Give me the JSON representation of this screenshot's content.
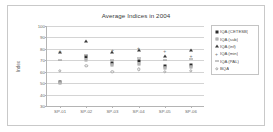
{
  "chart_data": {
    "type": "scatter",
    "title": "Average Indices in 2004",
    "xlabel": "",
    "ylabel": "Index",
    "grid": true,
    "legend_position": "right",
    "ylim": [
      30,
      100
    ],
    "yticks": [
      30,
      40,
      50,
      60,
      70,
      80,
      90,
      100
    ],
    "categories": [
      "SP-01",
      "SP-02",
      "SP-03",
      "SP-04",
      "SP-05",
      "SP-06"
    ],
    "series": [
      {
        "name": "IQA (CETESB)",
        "marker": "filled-square",
        "color": "#2b2b2b",
        "values": [
          51,
          73,
          68,
          69,
          65,
          66
        ]
      },
      {
        "name": "IQA (sub)",
        "marker": "open-square",
        "color": "#9a9a9a",
        "values": [
          50,
          70,
          66,
          67,
          63,
          64
        ]
      },
      {
        "name": "IQA (inf)",
        "marker": "filled-triangle",
        "color": "#3a3a3a",
        "values": [
          77,
          87,
          77,
          79,
          74,
          79
        ]
      },
      {
        "name": "IQA (min)",
        "marker": "plus",
        "color": "#777777",
        "values": [
          78,
          75,
          79,
          81,
          78,
          74
        ]
      },
      {
        "name": "IQA (PAL)",
        "marker": "dash",
        "color": "#8c8c8c",
        "values": [
          70,
          75,
          70,
          72,
          70,
          71
        ]
      },
      {
        "name": "BQA",
        "marker": "open-circle",
        "color": "#a8a8a8",
        "values": [
          61,
          65,
          60,
          62,
          60,
          61
        ]
      }
    ]
  },
  "legend": {
    "items": [
      {
        "label": "IQA (CETESB)"
      },
      {
        "label": "IQA (sub)"
      },
      {
        "label": "IQA (inf)"
      },
      {
        "label": "IQA (min)"
      },
      {
        "label": "IQA (PAL)"
      },
      {
        "label": "BQA"
      }
    ]
  }
}
